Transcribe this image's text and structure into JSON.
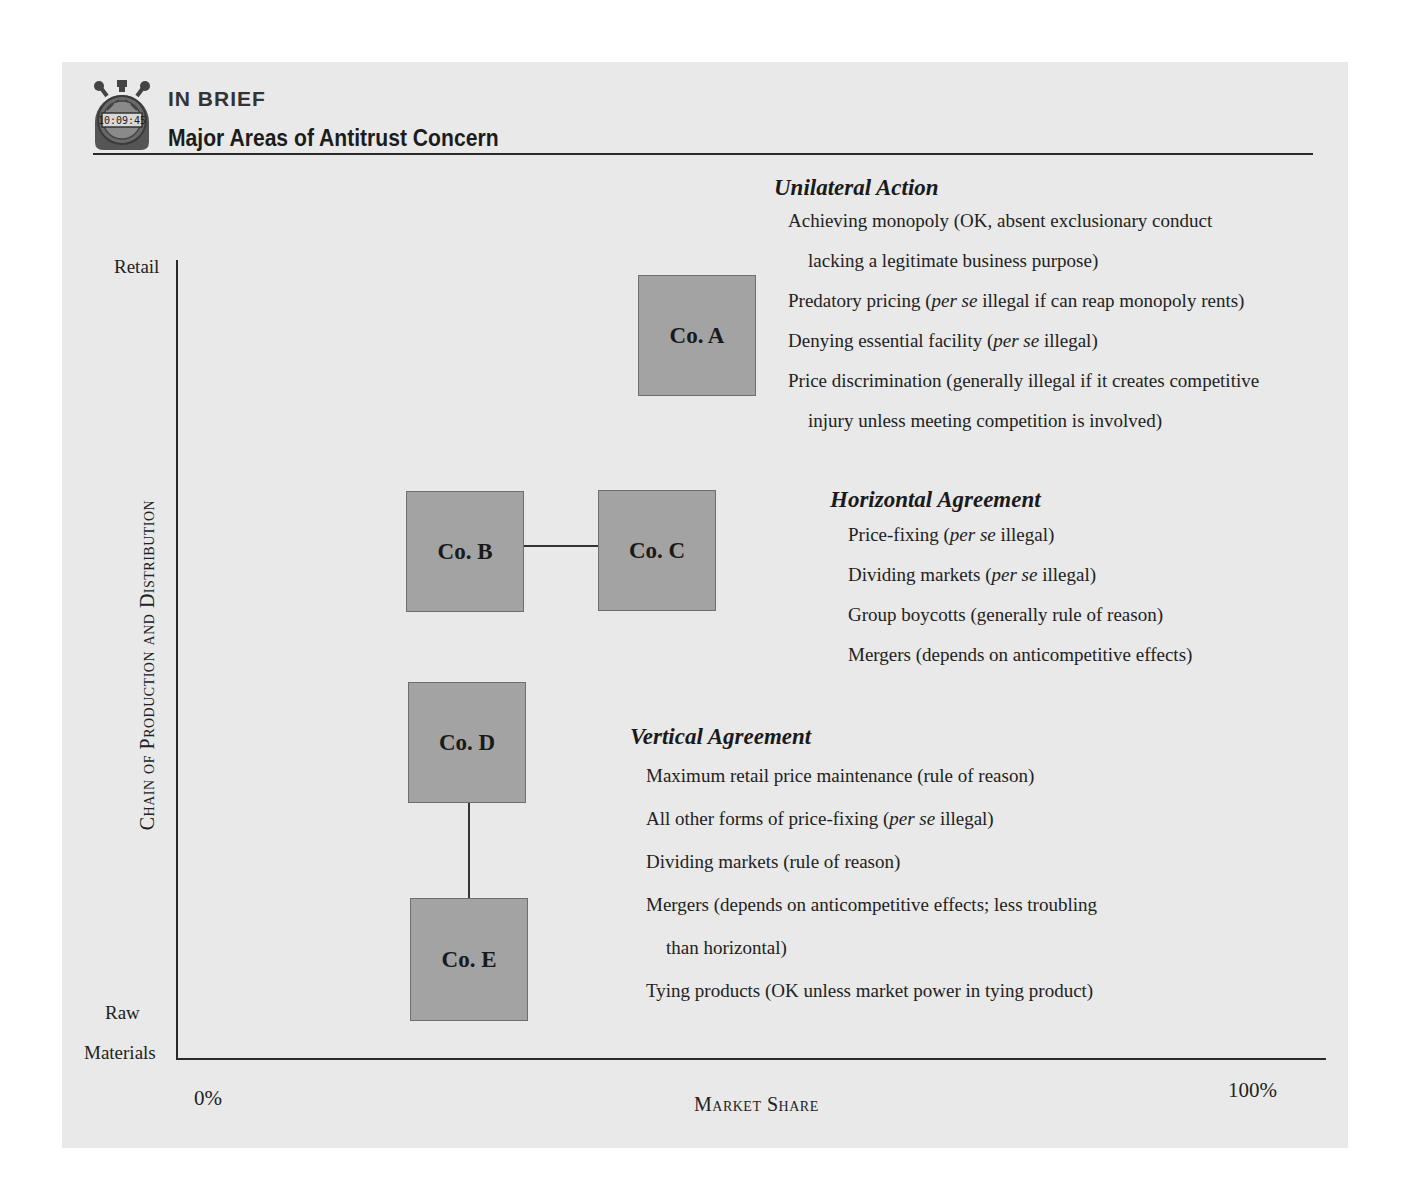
{
  "header": {
    "badge_icon": "stopwatch-icon",
    "stopwatch_display": "10:09:45",
    "label": "IN BRIEF",
    "title": "Major Areas of Antitrust Concern"
  },
  "axes": {
    "y_label": "Chain of Production and Distribution",
    "y_top": "Retail",
    "y_bottom_line1": "Raw",
    "y_bottom_line2": "Materials",
    "x_label": "Market Share",
    "x_min": "0%",
    "x_max": "100%"
  },
  "companies": {
    "a": "Co. A",
    "b": "Co. B",
    "c": "Co. C",
    "d": "Co. D",
    "e": "Co. E"
  },
  "sections": {
    "unilateral": {
      "heading": "Unilateral Action",
      "items": [
        {
          "pre": "Achieving monopoly (OK, absent exclusionary conduct",
          "em": "",
          "post": ""
        },
        {
          "pre": "lacking a legitimate business  purpose)",
          "em": "",
          "post": ""
        },
        {
          "pre": "Predatory pricing (",
          "em": "per se",
          "post": " illegal if can reap monopoly rents)"
        },
        {
          "pre": "Denying essential facility (",
          "em": "per se",
          "post": " illegal)"
        },
        {
          "pre": "Price discrimination (generally illegal if it creates competitive",
          "em": "",
          "post": ""
        },
        {
          "pre": "injury unless meeting competition is involved)",
          "em": "",
          "post": ""
        }
      ]
    },
    "horizontal": {
      "heading": "Horizontal Agreement",
      "items": [
        {
          "pre": "Price-fixing (",
          "em": "per se",
          "post": " illegal)"
        },
        {
          "pre": "Dividing markets (",
          "em": "per se",
          "post": " illegal)"
        },
        {
          "pre": "Group boycotts (generally rule of reason)",
          "em": "",
          "post": ""
        },
        {
          "pre": "Mergers (depends on anticompetitive effects)",
          "em": "",
          "post": ""
        }
      ]
    },
    "vertical": {
      "heading": "Vertical Agreement",
      "items": [
        {
          "pre": "Maximum retail price maintenance (rule of reason)",
          "em": "",
          "post": ""
        },
        {
          "pre": "All other forms of price-fixing (",
          "em": "per se",
          "post": " illegal)"
        },
        {
          "pre": "Dividing markets (rule of reason)",
          "em": "",
          "post": ""
        },
        {
          "pre": "Mergers (depends on anticompetitive effects; less troubling",
          "em": "",
          "post": ""
        },
        {
          "pre": "than horizontal)",
          "em": "",
          "post": ""
        },
        {
          "pre": "Tying products (OK unless market power in tying product)",
          "em": "",
          "post": ""
        }
      ]
    }
  }
}
